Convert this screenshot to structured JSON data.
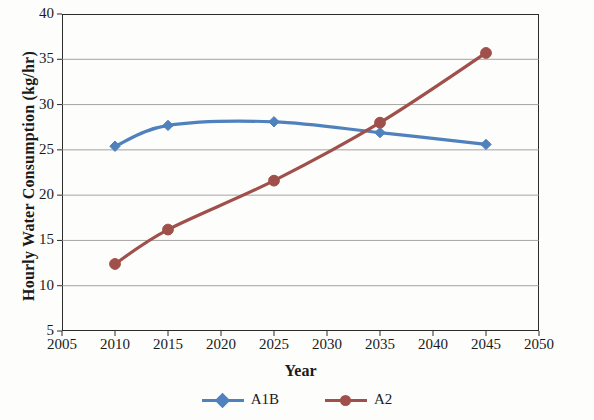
{
  "chart_data": {
    "type": "line",
    "title": "",
    "xlabel": "Year",
    "ylabel": "Hourly Water Consumption (kg/hr)",
    "x": [
      2010,
      2015,
      2025,
      2035,
      2045
    ],
    "xlim": [
      2005,
      2050
    ],
    "ylim": [
      5,
      40
    ],
    "xticks": [
      2005,
      2010,
      2015,
      2020,
      2025,
      2030,
      2035,
      2040,
      2045,
      2050
    ],
    "yticks": [
      5,
      10,
      15,
      20,
      25,
      30,
      35,
      40
    ],
    "grid": "horizontal",
    "legend_position": "bottom",
    "series": [
      {
        "name": "A1B",
        "color": "#4f81bd",
        "marker": "diamond",
        "values": [
          25.4,
          27.7,
          28.1,
          26.9,
          25.6
        ]
      },
      {
        "name": "A2",
        "color": "#a0504a",
        "marker": "circle",
        "values": [
          12.4,
          16.2,
          21.6,
          28.0,
          35.7
        ]
      }
    ]
  },
  "axes": {
    "y_title": "Hourly Water Consumption (kg/hr)",
    "x_title": "Year",
    "y_tick_labels": [
      "40",
      "35",
      "30",
      "25",
      "20",
      "15",
      "10",
      "5"
    ],
    "x_tick_labels": [
      "2005",
      "2010",
      "2015",
      "2020",
      "2025",
      "2030",
      "2035",
      "2040",
      "2045",
      "2050"
    ]
  },
  "legend": {
    "items": [
      {
        "label": "A1B",
        "color": "#4f81bd",
        "marker": "diamond"
      },
      {
        "label": "A2",
        "color": "#a0504a",
        "marker": "circle"
      }
    ]
  },
  "colors": {
    "series_a1b": "#4f81bd",
    "series_a2": "#a0504a",
    "axis": "#2b2b2b",
    "gridline": "#8d8d8d",
    "background": "#fdfdfc"
  }
}
